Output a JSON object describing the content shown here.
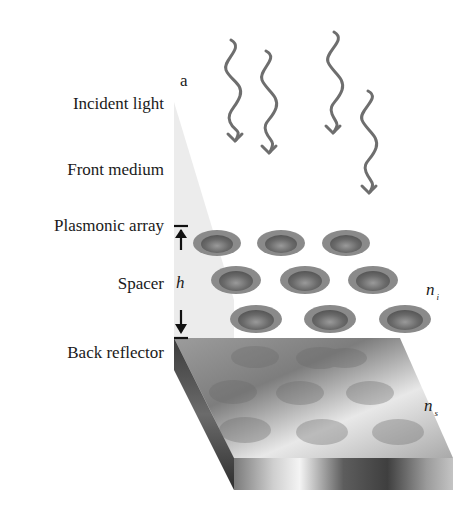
{
  "figure": {
    "panel_label": "a",
    "layers": [
      {
        "id": "incident",
        "label": "Incident light"
      },
      {
        "id": "front",
        "label": "Front medium"
      },
      {
        "id": "array",
        "label": "Plasmonic array"
      },
      {
        "id": "spacer",
        "label": "Spacer"
      },
      {
        "id": "reflector",
        "label": "Back reflector"
      }
    ],
    "spacer_thickness_symbol": "h",
    "refractive_index_i": {
      "base": "n",
      "sub": "i"
    },
    "refractive_index_s": {
      "base": "n",
      "sub": "s"
    },
    "incident_ray_count": 4,
    "particle_grid": {
      "rows": 3,
      "cols": 3
    }
  },
  "colors": {
    "text": "#1a1a1a",
    "ray": "#6e6e6e",
    "plane": "#e4e4e4",
    "particle_rim": "#8a8a8a",
    "particle_core": "#6f6f6f"
  }
}
